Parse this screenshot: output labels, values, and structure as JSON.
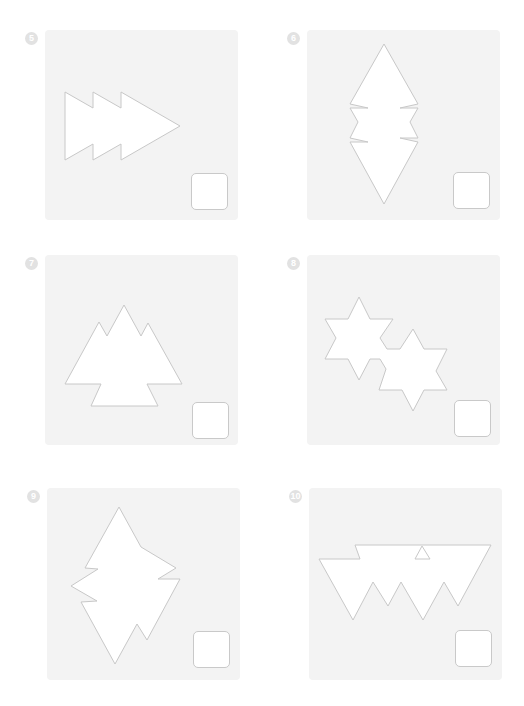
{
  "worksheet": {
    "items": [
      {
        "number": "5",
        "shape": "arrow-of-three-stacked-triangles",
        "answer": ""
      },
      {
        "number": "6",
        "shape": "notched-vertical-diamond",
        "answer": ""
      },
      {
        "number": "7",
        "shape": "mountain-triangle-cluster",
        "answer": ""
      },
      {
        "number": "8",
        "shape": "two-overlapping-six-point-stars",
        "answer": ""
      },
      {
        "number": "9",
        "shape": "jagged-diamond",
        "answer": ""
      },
      {
        "number": "10",
        "shape": "inverted-zigzag-trapezoid-with-triangle-hole",
        "answer": ""
      }
    ]
  },
  "colors": {
    "panel_bg": "#f3f3f3",
    "outline": "#c8c8c8",
    "badge": "#e2e2e2",
    "box_border": "#c9c9c9"
  }
}
